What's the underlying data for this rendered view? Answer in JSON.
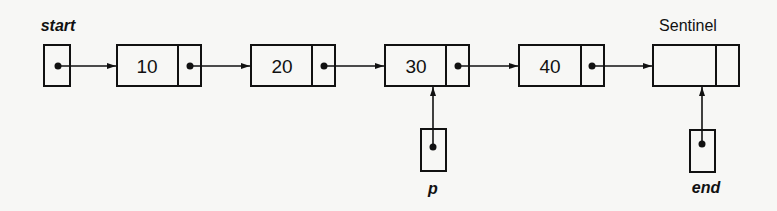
{
  "diagram": {
    "type": "linked-list",
    "labels": {
      "start": "start",
      "sentinel": "Sentinel",
      "p": "p",
      "end": "end"
    },
    "nodes": [
      {
        "value": "10"
      },
      {
        "value": "20"
      },
      {
        "value": "30"
      },
      {
        "value": "40"
      },
      {
        "value": ""
      }
    ],
    "pointers": [
      {
        "name": "start",
        "target": "node 10"
      },
      {
        "name": "p",
        "target": "node 30"
      },
      {
        "name": "end",
        "target": "Sentinel"
      }
    ]
  }
}
